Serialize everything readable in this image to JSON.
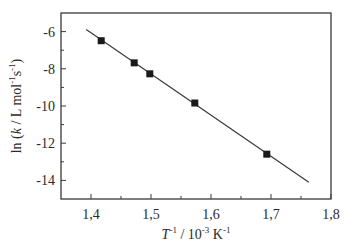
{
  "chart_data": {
    "type": "scatter",
    "title": "",
    "xlabel": "T⁻¹ / 10⁻³ K⁻¹",
    "xlabel_parts": {
      "var": "T",
      "var_sup": "-1",
      "mid": " / 10",
      "mid_sup": "-3",
      "unit": " K",
      "unit_sup": "-1"
    },
    "ylabel": "ln (k / L mol⁻¹s⁻¹)",
    "ylabel_parts": {
      "pre": "ln (",
      "var": "k",
      "mid": " / L mol",
      "sup1": "-1",
      "s": "s",
      "sup2": "-1",
      "post": ")"
    },
    "xlim": [
      1.35,
      1.8
    ],
    "ylim": [
      -15,
      -5
    ],
    "x_ticks": [
      1.4,
      1.5,
      1.6,
      1.7,
      1.8
    ],
    "x_tick_labels": [
      "1,4",
      "1,5",
      "1,6",
      "1,7",
      "1,8"
    ],
    "x_minor_ticks": [
      1.45,
      1.55,
      1.65,
      1.75
    ],
    "y_ticks": [
      -6,
      -8,
      -10,
      -12,
      -14
    ],
    "y_tick_labels": [
      "-6",
      "-8",
      "-10",
      "-12",
      "-14"
    ],
    "y_minor_ticks": [
      -7,
      -9,
      -11,
      -13
    ],
    "grid": false,
    "legend": null,
    "series": [
      {
        "name": "data",
        "marker": "square",
        "color": "#1a1a1a",
        "x": [
          1.417,
          1.472,
          1.498,
          1.573,
          1.693
        ],
        "y": [
          -6.49,
          -7.68,
          -8.27,
          -9.84,
          -12.59
        ]
      },
      {
        "name": "linear fit",
        "style": "line",
        "color": "#3a3a3a",
        "x": [
          1.392,
          1.763
        ],
        "y": [
          -5.89,
          -14.1
        ]
      }
    ]
  },
  "colors": {
    "axis": "#3a3a3a",
    "marker": "#1a1a1a",
    "fit_line": "#3a3a3a",
    "text": "#2a2a2a",
    "background": "#ffffff"
  }
}
